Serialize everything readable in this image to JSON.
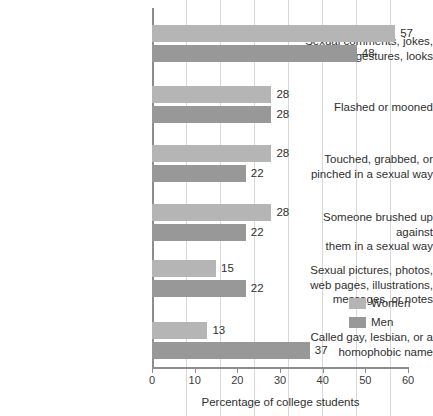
{
  "chart_data": {
    "type": "bar",
    "orientation": "horizontal",
    "title": "",
    "xlabel": "Percentage of college students",
    "ylabel": "",
    "xlim": [
      0,
      60
    ],
    "xticks": [
      0,
      10,
      20,
      30,
      40,
      50,
      60
    ],
    "grid": true,
    "legend_position": "right",
    "categories": [
      "Sexual comments, jokes, gestures, looks",
      "Flashed or mooned",
      "Touched, grabbed, or pinched in a sexual way",
      "Someone brushed up against them in a sexual way",
      "Sexual pictures, photos, web pages, illustrations, messages, or notes",
      "Called gay, lesbian, or a homophobic name"
    ],
    "category_lines": [
      [
        "Sexual comments, jokes,",
        "gestures, looks"
      ],
      [
        "Flashed or mooned"
      ],
      [
        "Touched, grabbed, or",
        "pinched in a sexual way"
      ],
      [
        "Someone brushed up against",
        "them in a sexual way"
      ],
      [
        "Sexual pictures, photos,",
        "web pages, illustrations,",
        "messages, or notes"
      ],
      [
        "Called gay, lesbian, or a",
        "homophobic name"
      ]
    ],
    "series": [
      {
        "name": "Women",
        "color": "#b5b5b5",
        "values": [
          57,
          28,
          28,
          28,
          15,
          13
        ]
      },
      {
        "name": "Men",
        "color": "#989898",
        "values": [
          48,
          28,
          22,
          22,
          22,
          37
        ]
      }
    ]
  },
  "legend": {
    "items": [
      {
        "label": "Women"
      },
      {
        "label": "Men"
      }
    ]
  },
  "axis": {
    "x_title": "Percentage of college students",
    "tick_labels": [
      "0",
      "10",
      "20",
      "30",
      "40",
      "50",
      "60"
    ]
  },
  "colors": {
    "women": "#b5b5b5",
    "men": "#989898",
    "grid": "#d8d8d8",
    "axis": "#8d8d8d",
    "text": "#2f2f2f",
    "background": "#ffffff"
  }
}
